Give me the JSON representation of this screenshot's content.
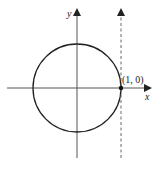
{
  "diagram": {
    "type": "unit-circle-with-tangent",
    "axes": {
      "x_label": "x",
      "y_label": "y",
      "origin_px": [
        77,
        88
      ]
    },
    "circle": {
      "center": [
        0,
        0
      ],
      "radius": 1,
      "radius_px": 44
    },
    "tangent_line": {
      "equation": "x = 1",
      "style": "dashed",
      "direction": "upward-arrow"
    },
    "point": {
      "label": "(1, 0)",
      "coords": [
        1,
        0
      ]
    },
    "colors": {
      "stroke": "#222222",
      "axis": "#555555",
      "dashed": "#666666",
      "background": "#ffffff"
    }
  }
}
